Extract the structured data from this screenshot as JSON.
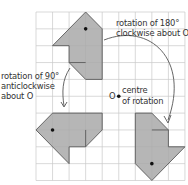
{
  "diagram": {
    "colors": {
      "grid": "#c8c8c8",
      "shape_fill": "#a9a9a9",
      "shape_stroke": "#5a5a5a",
      "arrow": "#555555",
      "text": "#333333",
      "dot": "#111111"
    },
    "grid": {
      "origin_px": [
        36,
        12
      ],
      "cell_px": [
        16.55,
        16.85
      ],
      "cols": 9,
      "rows": 10
    },
    "centre": {
      "grid": [
        5,
        5
      ],
      "label": "O"
    },
    "shapes": [
      {
        "name": "original",
        "vertices": [
          [
            3,
            0
          ],
          [
            4,
            1
          ],
          [
            4,
            4
          ],
          [
            3,
            4
          ],
          [
            2,
            3
          ],
          [
            2,
            2
          ],
          [
            1,
            2
          ]
        ],
        "inner_line": [
          [
            2,
            3
          ],
          [
            3,
            3
          ]
        ],
        "dot": [
          3,
          1
        ]
      },
      {
        "name": "rotated-180",
        "vertices": [
          [
            7,
            10
          ],
          [
            6,
            9
          ],
          [
            6,
            6
          ],
          [
            7,
            6
          ],
          [
            8,
            7
          ],
          [
            8,
            8
          ],
          [
            9,
            8
          ]
        ],
        "inner_line": [
          [
            8,
            7
          ],
          [
            7,
            7
          ]
        ],
        "dot": [
          7,
          9
        ]
      },
      {
        "name": "rotated-90-anticlockwise",
        "vertices": [
          [
            0,
            7
          ],
          [
            1,
            6
          ],
          [
            4,
            6
          ],
          [
            4,
            7
          ],
          [
            3,
            8
          ],
          [
            2,
            8
          ],
          [
            2,
            9
          ]
        ],
        "inner_line": [
          [
            3,
            8
          ],
          [
            3,
            7
          ]
        ],
        "dot": [
          1,
          7
        ]
      }
    ],
    "labels": {
      "rot180_line1": "rotation of 180°",
      "rot180_line2": "clockwise about O",
      "rot90_line1": "rotation of 90°",
      "rot90_line2": "anticlockwise",
      "rot90_line3": "about O",
      "centre_letter": "O",
      "centre_line1": "centre",
      "centre_line2": "of rotation"
    }
  }
}
